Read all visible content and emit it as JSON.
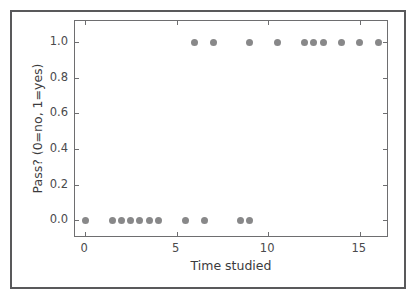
{
  "chart_data": {
    "type": "scatter",
    "title": "",
    "xlabel": "Time studied",
    "ylabel": "Pass? (0=no, 1=yes)",
    "xlim": [
      -0.55,
      16.6
    ],
    "ylim": [
      -0.1,
      1.12
    ],
    "xticks": [
      0,
      5,
      10,
      15
    ],
    "xticklabels": [
      "0",
      "5",
      "10",
      "15"
    ],
    "yticks": [
      0.0,
      0.2,
      0.4,
      0.6,
      0.8,
      1.0
    ],
    "yticklabels": [
      "0.0",
      "0.2",
      "0.4",
      "0.6",
      "0.8",
      "1.0"
    ],
    "grid": false,
    "legend": null,
    "marker": {
      "shape": "circle",
      "color": "#888889",
      "size_px": 7
    },
    "points": [
      {
        "x": 0.0,
        "y": 0
      },
      {
        "x": 1.5,
        "y": 0
      },
      {
        "x": 2.0,
        "y": 0
      },
      {
        "x": 2.5,
        "y": 0
      },
      {
        "x": 3.0,
        "y": 0
      },
      {
        "x": 3.5,
        "y": 0
      },
      {
        "x": 4.0,
        "y": 0
      },
      {
        "x": 5.5,
        "y": 0
      },
      {
        "x": 6.5,
        "y": 0
      },
      {
        "x": 8.5,
        "y": 0
      },
      {
        "x": 9.0,
        "y": 0
      },
      {
        "x": 6.0,
        "y": 1
      },
      {
        "x": 7.0,
        "y": 1
      },
      {
        "x": 9.0,
        "y": 1
      },
      {
        "x": 10.5,
        "y": 1
      },
      {
        "x": 12.0,
        "y": 1
      },
      {
        "x": 12.5,
        "y": 1
      },
      {
        "x": 13.0,
        "y": 1
      },
      {
        "x": 14.0,
        "y": 1
      },
      {
        "x": 15.0,
        "y": 1
      },
      {
        "x": 16.0,
        "y": 1
      }
    ]
  },
  "style": {
    "figure_background": "#ffffff",
    "axes_edge_color": "#6e6e70",
    "outer_border_color": "#59595b",
    "tick_label_color": "#4a4a4c",
    "axis_label_color": "#3b3b3d"
  }
}
